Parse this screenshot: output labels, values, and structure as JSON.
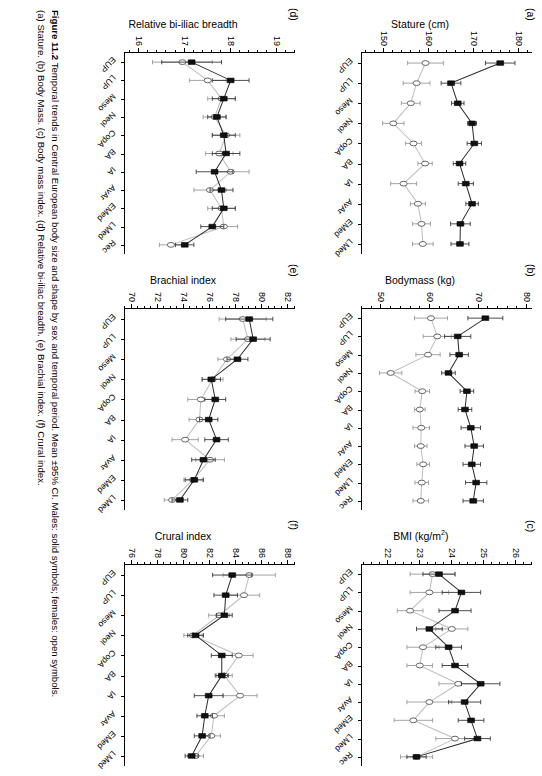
{
  "caption": {
    "label": "Figure 11.2",
    "text": "Temporal trends in Central European body size and shape by sex and temporal period. Mean ±95% CI. Males: solid symbols; females: open symbols.",
    "text2": "(a) Stature. (b) Body Mass. (c) Body mass index. (d) Relative bi-iliac breadth. (e) Brachial index. (f) Crural index."
  },
  "legend": {
    "males": "Males: solid symbols",
    "females": "females: open symbols",
    "male_color": "#111111",
    "female_color": "#ffffff",
    "male_line_color": "#2a2a2a",
    "female_line_color": "#bdbdbd"
  },
  "chart_data": [
    {
      "type": "scatter",
      "panel": "a",
      "title": "(a)",
      "ylabel": "Stature (cm)",
      "xlabel": "",
      "categories": [
        "EUP",
        "LUP",
        "Meso",
        "Neol",
        "CopA",
        "BA",
        "IA",
        "AvAr",
        "EMed",
        "LMed"
      ],
      "ylim": [
        145,
        183
      ],
      "yticks": [
        150,
        160,
        170,
        180
      ],
      "ytick_labels": [
        "150",
        "160",
        "170",
        "180"
      ],
      "yminor_step": 2,
      "series": [
        {
          "name": "Males",
          "symbol": "solid-square",
          "values": [
            175.9,
            164.9,
            166.4,
            169.6,
            170.1,
            166.8,
            168.2,
            169.6,
            167.0,
            166.9
          ],
          "ci_low": [
            172.6,
            162.7,
            165.0,
            168.6,
            168.5,
            165.4,
            166.5,
            168.2,
            164.8,
            164.9
          ],
          "ci_high": [
            179.2,
            167.1,
            167.8,
            170.6,
            171.7,
            168.2,
            169.9,
            171.0,
            169.2,
            168.9
          ]
        },
        {
          "name": "Females",
          "symbol": "open-circle",
          "values": [
            159.2,
            157.2,
            155.9,
            152.0,
            156.5,
            159.1,
            154.3,
            157.5,
            158.3,
            158.6
          ],
          "ci_low": [
            155.2,
            154.2,
            153.8,
            149.6,
            154.7,
            157.5,
            151.4,
            155.8,
            156.3,
            156.3
          ],
          "ci_high": [
            163.2,
            160.2,
            158.0,
            154.4,
            158.3,
            160.7,
            157.2,
            159.2,
            160.3,
            160.9
          ]
        }
      ]
    },
    {
      "type": "scatter",
      "panel": "b",
      "title": "(b)",
      "ylabel": "Bodymass (kg)",
      "xlabel": "",
      "categories": [
        "EUP",
        "LUP",
        "Meso",
        "Neol",
        "CopA",
        "BA",
        "IA",
        "AvAr",
        "EMed",
        "LMed",
        "Rec"
      ],
      "ylim": [
        46,
        81
      ],
      "yticks": [
        50,
        60,
        70,
        80
      ],
      "ytick_labels": [
        "50",
        "60",
        "70",
        "80"
      ],
      "yminor_step": 2,
      "series": [
        {
          "name": "Males",
          "symbol": "solid-square",
          "values": [
            71.4,
            65.7,
            66.0,
            63.8,
            67.6,
            67.2,
            68.4,
            69.1,
            68.6,
            69.5,
            68.9
          ],
          "ci_low": [
            67.8,
            63.0,
            64.1,
            62.4,
            66.2,
            65.8,
            66.4,
            67.2,
            66.8,
            67.3,
            66.8
          ],
          "ci_high": [
            75.0,
            68.4,
            67.9,
            65.2,
            69.0,
            68.6,
            70.4,
            71.0,
            70.4,
            71.7,
            71.0
          ]
        },
        {
          "name": "Females",
          "symbol": "open-circle",
          "values": [
            60.2,
            61.5,
            59.6,
            51.9,
            58.4,
            57.9,
            58.2,
            58.1,
            58.6,
            58.3,
            58.1
          ],
          "ci_low": [
            56.8,
            58.6,
            57.1,
            49.6,
            56.9,
            56.8,
            56.5,
            56.8,
            57.3,
            56.9,
            56.5
          ],
          "ci_high": [
            63.6,
            64.4,
            62.1,
            54.2,
            59.9,
            59.0,
            59.9,
            59.4,
            59.9,
            59.7,
            59.7
          ]
        }
      ]
    },
    {
      "type": "scatter",
      "panel": "c",
      "title": "(c)",
      "ylabel": "BMI (kg/m2)",
      "xlabel": "",
      "categories": [
        "EUP",
        "LUP",
        "Meso",
        "Neol",
        "CopA",
        "BA",
        "IA",
        "AvAr",
        "EMed",
        "LMed",
        "Rec"
      ],
      "ylim": [
        21.2,
        26.5
      ],
      "yticks": [
        21,
        22,
        23,
        24,
        25,
        26
      ],
      "ytick_labels": [
        "21",
        "22",
        "23",
        "24",
        "25",
        "26"
      ],
      "yminor_step": 0.25,
      "series": [
        {
          "name": "Males",
          "symbol": "solid-square",
          "values": [
            23.6,
            24.3,
            24.1,
            23.3,
            23.9,
            24.1,
            24.9,
            24.4,
            24.6,
            24.8,
            22.9
          ],
          "ci_low": [
            23.1,
            23.7,
            23.6,
            22.9,
            23.5,
            23.7,
            24.3,
            23.9,
            24.2,
            24.4,
            22.6
          ],
          "ci_high": [
            24.1,
            24.9,
            24.6,
            23.7,
            24.3,
            24.5,
            25.5,
            24.9,
            25.0,
            25.2,
            23.2
          ]
        },
        {
          "name": "Females",
          "symbol": "open-circle",
          "values": [
            23.4,
            23.3,
            22.7,
            24.0,
            23.1,
            23.0,
            24.2,
            23.3,
            22.8,
            24.1,
            22.9
          ],
          "ci_low": [
            22.7,
            22.7,
            22.3,
            23.5,
            22.6,
            22.6,
            23.6,
            22.6,
            22.2,
            23.5,
            22.4
          ],
          "ci_high": [
            24.1,
            23.9,
            23.1,
            24.5,
            23.6,
            23.4,
            24.8,
            24.0,
            23.4,
            24.7,
            23.4
          ]
        }
      ]
    },
    {
      "type": "scatter",
      "panel": "d",
      "title": "(d)",
      "ylabel": "Relative biiliac breadth",
      "xlabel": "",
      "categories": [
        "EUP",
        "LUP",
        "Meso",
        "Neol",
        "CopA",
        "BA",
        "IA",
        "AvAr",
        "EMed",
        "LMed",
        "Rec"
      ],
      "ylim": [
        15.7,
        19.4
      ],
      "yticks": [
        16,
        17,
        18,
        19
      ],
      "ytick_labels": [
        "16",
        "17",
        "18",
        "19"
      ],
      "yminor_step": 0.2,
      "series": [
        {
          "name": "Males",
          "symbol": "solid-square",
          "values": [
            17.15,
            18.0,
            17.85,
            17.7,
            17.85,
            17.9,
            17.65,
            17.8,
            17.85,
            17.6,
            17.0
          ],
          "ci_low": [
            16.5,
            17.6,
            17.6,
            17.5,
            17.6,
            17.6,
            17.25,
            17.55,
            17.6,
            17.35,
            16.8
          ],
          "ci_high": [
            17.8,
            18.4,
            18.1,
            17.9,
            18.1,
            18.2,
            18.05,
            18.05,
            18.1,
            17.85,
            17.2
          ]
        },
        {
          "name": "Females",
          "symbol": "open-circle",
          "values": [
            16.95,
            17.5,
            17.8,
            17.65,
            17.9,
            17.75,
            18.0,
            17.55,
            17.8,
            17.85,
            16.7
          ],
          "ci_low": [
            16.3,
            17.1,
            17.5,
            17.4,
            17.6,
            17.45,
            17.6,
            17.2,
            17.5,
            17.55,
            16.45
          ],
          "ci_high": [
            17.6,
            17.9,
            18.1,
            17.9,
            18.2,
            18.05,
            18.4,
            17.9,
            18.1,
            18.15,
            16.95
          ]
        }
      ]
    },
    {
      "type": "scatter",
      "panel": "e",
      "title": "(e)",
      "ylabel": "Brachial index",
      "xlabel": "",
      "categories": [
        "EUP",
        "LUP",
        "Meso",
        "Neol",
        "CopA",
        "BA",
        "IA",
        "AvAr",
        "EMed",
        "LMed"
      ],
      "ylim": [
        69.5,
        82.5
      ],
      "yticks": [
        70,
        72,
        74,
        76,
        78,
        80,
        82
      ],
      "ytick_labels": [
        "70",
        "72",
        "74",
        "76",
        "78",
        "80",
        "82"
      ],
      "yminor_step": 0.5,
      "series": [
        {
          "name": "Males",
          "symbol": "solid-square",
          "values": [
            79.0,
            79.3,
            78.1,
            76.1,
            76.4,
            75.9,
            76.5,
            75.5,
            74.8,
            73.7
          ],
          "ci_low": [
            77.2,
            78.0,
            77.3,
            75.4,
            75.6,
            75.2,
            75.6,
            74.6,
            74.1,
            73.1
          ],
          "ci_high": [
            80.8,
            80.6,
            78.9,
            76.8,
            77.2,
            76.6,
            77.4,
            76.4,
            75.5,
            74.3
          ]
        },
        {
          "name": "Females",
          "symbol": "open-circle",
          "values": [
            78.5,
            78.9,
            77.3,
            76.2,
            75.3,
            75.2,
            74.1,
            76.0,
            74.7,
            73.1
          ],
          "ci_low": [
            76.7,
            77.6,
            76.6,
            75.4,
            74.3,
            74.4,
            73.1,
            74.9,
            74.0,
            72.5
          ],
          "ci_high": [
            80.3,
            80.2,
            78.0,
            77.0,
            76.3,
            76.0,
            75.1,
            77.1,
            75.4,
            73.7
          ]
        }
      ]
    },
    {
      "type": "scatter",
      "panel": "f",
      "title": "(f)",
      "ylabel": "Crural index",
      "xlabel": "",
      "categories": [
        "EUP",
        "LUP",
        "Meso",
        "Neol",
        "CopA",
        "BA",
        "IA",
        "AvAr",
        "EMed",
        "LMed"
      ],
      "ylim": [
        75.5,
        88.5
      ],
      "yticks": [
        76,
        78,
        80,
        82,
        84,
        86,
        88
      ],
      "ytick_labels": [
        "76",
        "78",
        "80",
        "82",
        "84",
        "86",
        "88"
      ],
      "yminor_step": 0.5,
      "series": [
        {
          "name": "Males",
          "symbol": "solid-square",
          "values": [
            83.7,
            83.2,
            83.1,
            80.9,
            82.9,
            82.9,
            81.9,
            81.6,
            81.4,
            80.6
          ],
          "ci_low": [
            82.2,
            82.3,
            82.5,
            80.3,
            82.1,
            82.4,
            80.8,
            81.0,
            80.8,
            80.1
          ],
          "ci_high": [
            85.2,
            84.1,
            83.7,
            81.5,
            83.7,
            83.4,
            83.0,
            82.2,
            82.0,
            81.1
          ]
        },
        {
          "name": "Females",
          "symbol": "open-circle",
          "values": [
            85.0,
            84.6,
            82.7,
            80.7,
            84.2,
            83.1,
            84.3,
            82.3,
            82.1,
            80.9
          ],
          "ci_low": [
            83.0,
            83.4,
            81.9,
            80.0,
            83.1,
            82.5,
            83.0,
            81.5,
            81.4,
            80.3
          ],
          "ci_high": [
            87.0,
            85.8,
            83.5,
            81.4,
            85.3,
            83.7,
            85.6,
            83.1,
            82.8,
            81.5
          ]
        }
      ]
    }
  ]
}
